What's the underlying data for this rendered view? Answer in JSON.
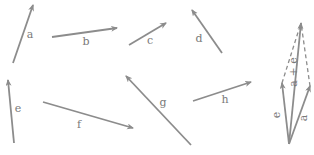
{
  "diagram": {
    "stroke_color": "#8c8c8c",
    "label_color": "#7a7a7a",
    "vectors": [
      {
        "id": "a",
        "label": "a",
        "x1": 13,
        "y1": 63,
        "x2": 33,
        "y2": 5,
        "lx": 30,
        "ly": 38
      },
      {
        "id": "b",
        "label": "b",
        "x1": 52,
        "y1": 37,
        "x2": 117,
        "y2": 28,
        "lx": 86,
        "ly": 45
      },
      {
        "id": "c",
        "label": "c",
        "x1": 129,
        "y1": 45,
        "x2": 166,
        "y2": 23,
        "lx": 150,
        "ly": 44
      },
      {
        "id": "d",
        "label": "d",
        "x1": 222,
        "y1": 53,
        "x2": 192,
        "y2": 10,
        "lx": 199,
        "ly": 42
      },
      {
        "id": "e",
        "label": "e",
        "x1": 14,
        "y1": 143,
        "x2": 8,
        "y2": 80,
        "lx": 18,
        "ly": 112
      },
      {
        "id": "f",
        "label": "f",
        "x1": 43,
        "y1": 102,
        "x2": 133,
        "y2": 128,
        "lx": 79,
        "ly": 128
      },
      {
        "id": "g",
        "label": "g",
        "x1": 191,
        "y1": 145,
        "x2": 126,
        "y2": 76,
        "lx": 163,
        "ly": 106
      },
      {
        "id": "h",
        "label": "h",
        "x1": 193,
        "y1": 101,
        "x2": 251,
        "y2": 82,
        "lx": 225,
        "ly": 103
      }
    ],
    "parallelogram": {
      "origin": {
        "x": 289,
        "y": 144
      },
      "vectors": [
        {
          "id": "e",
          "label": "e",
          "x2": 282,
          "y2": 83,
          "lx": 280,
          "ly": 115
        },
        {
          "id": "a",
          "label": "a",
          "x2": 310,
          "y2": 86,
          "lx": 307,
          "ly": 118
        }
      ],
      "sum": {
        "label": "a + e",
        "x2": 301,
        "y2": 23,
        "lx": 297,
        "ly": 72
      },
      "dashed_edges": [
        {
          "x1": 282,
          "y1": 83,
          "x2": 301,
          "y2": 23
        },
        {
          "x1": 310,
          "y1": 86,
          "x2": 301,
          "y2": 23
        }
      ]
    }
  }
}
